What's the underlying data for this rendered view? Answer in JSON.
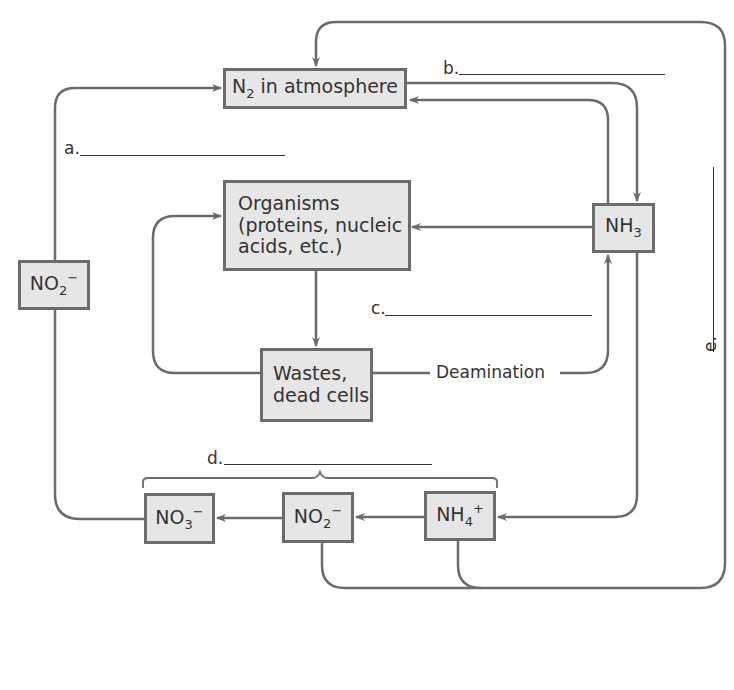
{
  "diagram": {
    "boxes": {
      "n2": {
        "main": "N",
        "sub": "2",
        "rest": " in atmosphere"
      },
      "organisms": {
        "line1": "Organisms",
        "line2": "(proteins, nucleic",
        "line3": "acids, etc.)"
      },
      "nh3": {
        "main": "NH",
        "sub": "3"
      },
      "wastes": {
        "line1": "Wastes,",
        "line2": "dead cells"
      },
      "no2_left": {
        "main": "NO",
        "sub": "2",
        "sup": "−"
      },
      "no3": {
        "main": "NO",
        "sub": "3",
        "sup": "−"
      },
      "no2_bottom": {
        "main": "NO",
        "sub": "2",
        "sup": "−"
      },
      "nh4": {
        "main": "NH",
        "sub": "4",
        "sup": "+"
      }
    },
    "labels": {
      "a": "a.",
      "b": "b.",
      "c": "c.",
      "d": "d.",
      "e": "e.",
      "deamination": "Deamination"
    },
    "colors": {
      "line": "#6b6b6b",
      "box_fill": "#e6e6e6",
      "box_border": "#6b6b6b"
    }
  }
}
